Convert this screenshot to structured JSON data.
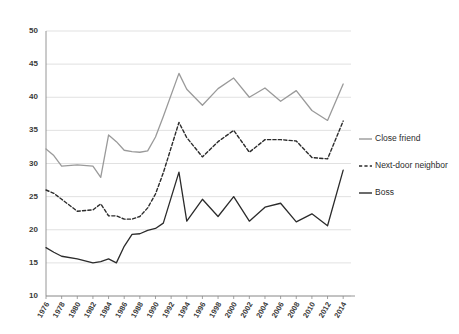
{
  "chart_data": {
    "type": "line",
    "title": "",
    "subtitle": "",
    "xlabel": "",
    "ylabel": "",
    "xlim": [
      1976,
      2015
    ],
    "ylim": [
      10,
      50
    ],
    "grid": true,
    "legend_position": "right",
    "y_ticks": [
      10,
      15,
      20,
      25,
      30,
      35,
      40,
      45,
      50
    ],
    "x_ticks": [
      1976,
      1978,
      1980,
      1982,
      1984,
      1986,
      1988,
      1990,
      1992,
      1994,
      1996,
      1998,
      2000,
      2002,
      2004,
      2006,
      2008,
      2010,
      2012,
      2014
    ],
    "x": [
      1976,
      1977,
      1978,
      1980,
      1982,
      1983,
      1984,
      1985,
      1986,
      1987,
      1988,
      1989,
      1990,
      1991,
      1993,
      1994,
      1996,
      1998,
      2000,
      2002,
      2004,
      2006,
      2008,
      2010,
      2012,
      2014
    ],
    "series": [
      {
        "name": "Close friend",
        "color": "#9a9a9a",
        "style": "solid",
        "values": [
          32.2,
          31.2,
          29.6,
          29.8,
          29.6,
          27.9,
          34.3,
          33.3,
          32.0,
          31.8,
          31.7,
          31.9,
          34.0,
          37.1,
          43.6,
          41.2,
          38.8,
          41.3,
          42.9,
          40.0,
          41.4,
          39.4,
          41.0,
          38.0,
          36.5,
          42.0
        ]
      },
      {
        "name": "Next-door neighbor",
        "color": "#2b2b2b",
        "style": "dashed",
        "values": [
          26.0,
          25.5,
          24.6,
          22.8,
          23.0,
          23.9,
          22.1,
          22.1,
          21.6,
          21.6,
          22.0,
          23.3,
          25.4,
          28.6,
          36.2,
          33.9,
          31.0,
          33.3,
          35.0,
          31.7,
          33.6,
          33.6,
          33.4,
          30.9,
          30.7,
          36.4
        ]
      },
      {
        "name": "Boss",
        "color": "#2b2b2b",
        "style": "solid",
        "values": [
          17.3,
          16.6,
          16.0,
          15.6,
          15.0,
          15.2,
          15.6,
          15.0,
          17.5,
          19.3,
          19.4,
          19.9,
          20.2,
          21.0,
          28.7,
          21.3,
          24.6,
          22.0,
          25.0,
          21.3,
          23.4,
          24.0,
          21.2,
          22.4,
          20.6,
          29.0
        ]
      }
    ]
  },
  "legend": {
    "items": [
      {
        "label": "Close friend"
      },
      {
        "label": "Next-door neighbor"
      },
      {
        "label": "Boss"
      }
    ]
  }
}
